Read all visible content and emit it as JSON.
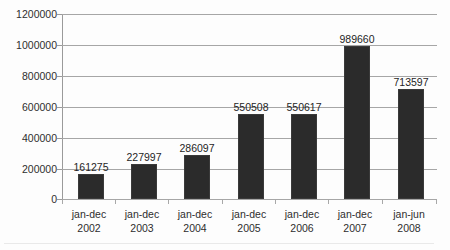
{
  "chart_data": {
    "type": "bar",
    "title": "",
    "xlabel": "",
    "ylabel": "",
    "ylim": [
      0,
      1200000
    ],
    "grid": true,
    "legend": "none",
    "categories": [
      "jan-dec 2002",
      "jan-dec 2003",
      "jan-dec 2004",
      "jan-dec 2005",
      "jan-dec 2006",
      "jan-dec 2007",
      "jan-jun 2008"
    ],
    "category_parts": [
      {
        "period": "jan-dec",
        "year": "2002"
      },
      {
        "period": "jan-dec",
        "year": "2003"
      },
      {
        "period": "jan-dec",
        "year": "2004"
      },
      {
        "period": "jan-dec",
        "year": "2005"
      },
      {
        "period": "jan-dec",
        "year": "2006"
      },
      {
        "period": "jan-dec",
        "year": "2007"
      },
      {
        "period": "jan-jun",
        "year": "2008"
      }
    ],
    "values": [
      161275,
      227997,
      286097,
      550508,
      550617,
      989660,
      713597
    ],
    "data_labels": [
      "161275",
      "227997",
      "286097",
      "550508",
      "550617",
      "989660",
      "713597"
    ],
    "ytick_values": [
      0,
      200000,
      400000,
      600000,
      800000,
      1000000,
      1200000
    ],
    "ytick_labels": [
      "0",
      "200000",
      "400000",
      "600000",
      "800000",
      "1000000",
      "1200000"
    ],
    "bar_color": "#2b2b2b",
    "gridline_color": "#a6a6a6",
    "background_color": "#fdfdfd"
  }
}
